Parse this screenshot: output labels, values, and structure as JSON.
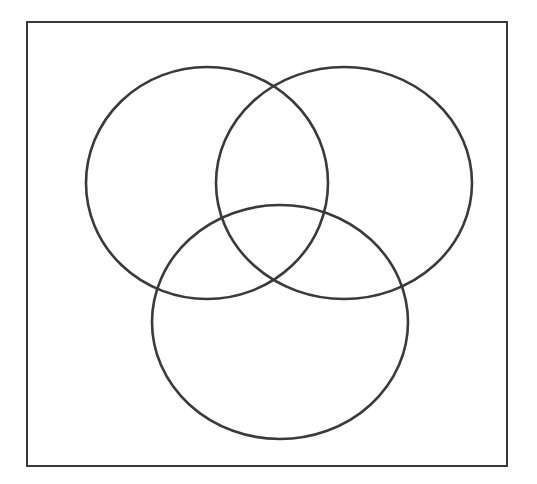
{
  "diagram": {
    "type": "venn-3",
    "colors": {
      "stroke": "#3a3a3a",
      "background": "#ffffff"
    },
    "frame": {
      "x": 27,
      "y": 22,
      "width": 480,
      "height": 444
    },
    "sets": [
      {
        "id": "left",
        "cx": 207,
        "cy": 183,
        "rx": 121,
        "ry": 116
      },
      {
        "id": "right",
        "cx": 344,
        "cy": 183,
        "rx": 128,
        "ry": 116
      },
      {
        "id": "bottom",
        "cx": 280,
        "cy": 322,
        "rx": 128,
        "ry": 117
      }
    ]
  }
}
